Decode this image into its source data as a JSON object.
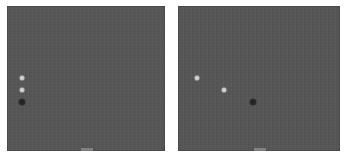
{
  "colors": {
    "background": "#ffffff",
    "panel_fill": "#555555",
    "dot_light": "#c8c8c8",
    "dot_dark": "#2a2a2a"
  },
  "panels": [
    {
      "id": "left",
      "caption": "",
      "dots": [
        {
          "tone": "light",
          "x": 14,
          "y": 71
        },
        {
          "tone": "light",
          "x": 14,
          "y": 83
        },
        {
          "tone": "dark",
          "x": 14,
          "y": 95
        }
      ]
    },
    {
      "id": "right",
      "caption": "",
      "dots": [
        {
          "tone": "light",
          "x": 18,
          "y": 71
        },
        {
          "tone": "light",
          "x": 45,
          "y": 83
        },
        {
          "tone": "dark",
          "x": 74,
          "y": 95
        }
      ]
    }
  ]
}
